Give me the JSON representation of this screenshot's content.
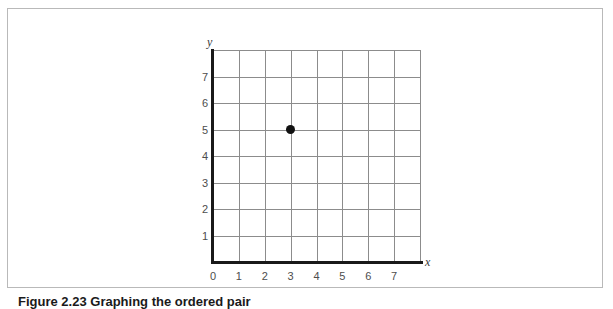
{
  "figure": {
    "caption_number": "Figure 2.23",
    "caption_text": "Graphing the ordered pair",
    "frame_color": "#b9b9b9"
  },
  "axes": {
    "x_axis_name": "x",
    "y_axis_name": "y",
    "axis_color": "#191919",
    "grid_color": "#8c8c8c"
  },
  "chart_data": {
    "type": "scatter",
    "title": "",
    "xlabel": "x",
    "ylabel": "y",
    "xlim": [
      0,
      8
    ],
    "ylim": [
      0,
      8
    ],
    "grid": true,
    "grid_step": 1,
    "legend": "none",
    "x_tick_labels": [
      "0",
      "1",
      "2",
      "3",
      "4",
      "5",
      "6",
      "7"
    ],
    "y_tick_labels": [
      "1",
      "2",
      "3",
      "4",
      "5",
      "6",
      "7"
    ],
    "x_ticks": [
      0,
      1,
      2,
      3,
      4,
      5,
      6,
      7
    ],
    "y_ticks": [
      1,
      2,
      3,
      4,
      5,
      6,
      7
    ],
    "series": [
      {
        "name": "point",
        "marker": "filled-circle",
        "color": "#111111",
        "points": [
          {
            "x": 3,
            "y": 5,
            "label": "(3, 5)"
          }
        ]
      }
    ]
  }
}
